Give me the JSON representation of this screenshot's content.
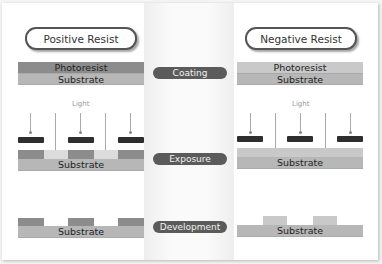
{
  "titles": {
    "positive": "Positive Resist",
    "negative": "Negative Resist"
  },
  "steps": {
    "coating": "Coating",
    "exposure": "Exposure",
    "development": "Development"
  },
  "layers": {
    "photoresist": "Photoresist",
    "substrate": "Substrate"
  },
  "light_label": "Light",
  "colors": {
    "dark_resist": "#8c8c8c",
    "light_resist": "#c9c9c9",
    "substrate": "#b7b7b7",
    "step_pill": "#5b5b5b",
    "mask": "#2e2e2e"
  }
}
